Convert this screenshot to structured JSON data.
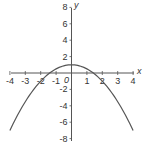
{
  "chart_data": {
    "type": "line",
    "title": "",
    "xlabel": "x",
    "ylabel": "y",
    "origin_label": "0",
    "xlim": [
      -4,
      4
    ],
    "ylim": [
      -8,
      8
    ],
    "x_ticks": [
      -4,
      -3,
      -2,
      -1,
      1,
      2,
      3,
      4
    ],
    "x_tick_labels": [
      "-4",
      "-3",
      "-2",
      "-1",
      "1",
      "2",
      "3",
      "4"
    ],
    "y_ticks": [
      8,
      6,
      4,
      2,
      -2,
      -4,
      -6,
      -8
    ],
    "y_tick_labels": [
      "8",
      "6",
      "4",
      "2",
      "-2",
      "-4",
      "-6",
      "-8"
    ],
    "grid": false,
    "legend": null,
    "series": [
      {
        "name": "y = 1 - x^2/2",
        "x": [
          -4,
          -3,
          -2,
          -1,
          0,
          1,
          2,
          3,
          4
        ],
        "y": [
          -7,
          -3.5,
          -1,
          0.5,
          1,
          0.5,
          -1,
          -3.5,
          -7
        ]
      }
    ],
    "colors": {
      "axis": "#555555",
      "curve": "#555555",
      "text": "#333333"
    }
  }
}
